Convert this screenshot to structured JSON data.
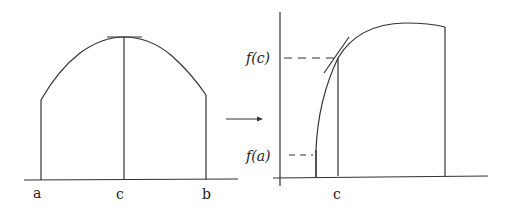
{
  "left_figure": {
    "labels": {
      "a": "a",
      "c": "c",
      "b": "b"
    }
  },
  "right_figure": {
    "labels": {
      "fc": "f(c)",
      "fa": "f(a)",
      "c": "c"
    }
  },
  "colors": {
    "stroke": "#333333",
    "background": "#ffffff"
  }
}
